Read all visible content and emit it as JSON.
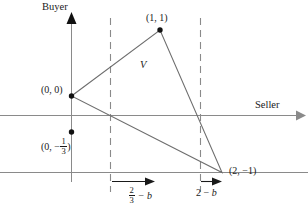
{
  "figure": {
    "type": "geometry-diagram",
    "axes": {
      "vertical_label": "Buyer",
      "horizontal_label": "Seller"
    },
    "points": [
      {
        "id": "origin",
        "label": "(0, 0)",
        "x": 0,
        "y": 0
      },
      {
        "id": "apex",
        "label": "(1, 1)",
        "x": 1,
        "y": 1
      },
      {
        "id": "right",
        "label": "(2, −1)",
        "x": 2,
        "y": -1
      }
    ],
    "marked_point": {
      "id": "neg-third",
      "label_prefix": "(0, −",
      "label_numerator": "1",
      "label_denominator": "3",
      "label_suffix": ")",
      "label_plain": "(0, −1/3)"
    },
    "region": {
      "label": "V"
    },
    "annotations": [
      {
        "id": "left-offset",
        "numerator": "2",
        "denominator": "3",
        "suffix": "− b",
        "plain": "2/3 − b"
      },
      {
        "id": "right-offset",
        "lead": "2 −",
        "variable": "b",
        "plain": "2 − b"
      }
    ],
    "colors": {
      "axis": "#8a8a8a",
      "triangle": "#6e6e6e",
      "dashed": "#8a8a8a",
      "dot": "#111111",
      "text": "#1a1a1a",
      "background": "#ffffff"
    }
  }
}
